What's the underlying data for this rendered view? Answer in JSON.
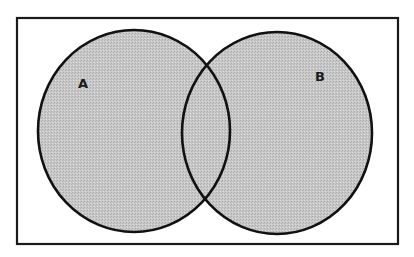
{
  "diagram": {
    "type": "venn",
    "universe": {
      "label": "",
      "x": 17,
      "y": 18,
      "width": 381,
      "height": 226,
      "stroke": "#1a1a1a",
      "fill": "#ffffff"
    },
    "sets": [
      {
        "id": "A",
        "label": "A",
        "cx": 134,
        "cy": 131,
        "rx": 96,
        "ry": 101,
        "label_x": 83,
        "label_y": 88
      },
      {
        "id": "B",
        "label": "B",
        "cx": 277,
        "cy": 133,
        "rx": 95,
        "ry": 101,
        "label_x": 320,
        "label_y": 81
      }
    ],
    "colors": {
      "fill": "#c6c6c6",
      "fill_dot": "#a8a8a8",
      "outline": "#111111"
    }
  }
}
